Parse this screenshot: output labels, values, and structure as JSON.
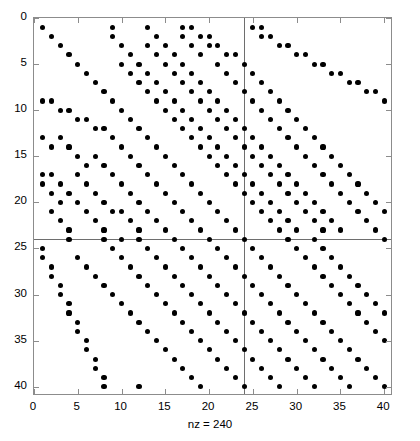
{
  "figure": {
    "type": "spy-plot",
    "background": "#ffffff",
    "marker_color": "#000000",
    "axis_color": "#8c8c8c",
    "line_color": "#6e6e6e"
  },
  "xlabel": "nz = 240",
  "axis": {
    "xticks": [
      0,
      5,
      10,
      15,
      20,
      25,
      30,
      35,
      40
    ],
    "yticks": [
      0,
      5,
      10,
      15,
      20,
      25,
      30,
      35,
      40
    ],
    "xlim": [
      0,
      41
    ],
    "ylim": [
      0,
      41
    ]
  },
  "chart_data": {
    "type": "scatter",
    "title": "",
    "xlabel": "nz = 240",
    "ylabel": "",
    "xlim": [
      0,
      41
    ],
    "ylim": [
      41,
      0
    ],
    "grid": false,
    "legend": null,
    "nz": 240,
    "matrix_size": [
      40,
      40
    ],
    "marker": "filled-circle",
    "full_row": 24,
    "full_column": 24,
    "points": [
      [
        1,
        1
      ],
      [
        1,
        9
      ],
      [
        1,
        13
      ],
      [
        1,
        17
      ],
      [
        1,
        18
      ],
      [
        1,
        25
      ],
      [
        1,
        26
      ],
      [
        2,
        2
      ],
      [
        2,
        9
      ],
      [
        2,
        14
      ],
      [
        2,
        17
      ],
      [
        2,
        19
      ],
      [
        2,
        20
      ],
      [
        2,
        26
      ],
      [
        2,
        27
      ],
      [
        3,
        3
      ],
      [
        3,
        10
      ],
      [
        3,
        13
      ],
      [
        3,
        15
      ],
      [
        3,
        18
      ],
      [
        3,
        20
      ],
      [
        3,
        21
      ],
      [
        3,
        28
      ],
      [
        3,
        29
      ],
      [
        4,
        4
      ],
      [
        4,
        11
      ],
      [
        4,
        14
      ],
      [
        4,
        16
      ],
      [
        4,
        19
      ],
      [
        4,
        22
      ],
      [
        4,
        23
      ],
      [
        4,
        30
      ],
      [
        4,
        31
      ],
      [
        5,
        5
      ],
      [
        5,
        10
      ],
      [
        5,
        12
      ],
      [
        5,
        15
      ],
      [
        5,
        17
      ],
      [
        5,
        21
      ],
      [
        5,
        24
      ],
      [
        5,
        32
      ],
      [
        5,
        33
      ],
      [
        6,
        6
      ],
      [
        6,
        11
      ],
      [
        6,
        13
      ],
      [
        6,
        16
      ],
      [
        6,
        18
      ],
      [
        6,
        22
      ],
      [
        6,
        25
      ],
      [
        6,
        34
      ],
      [
        6,
        35
      ],
      [
        7,
        7
      ],
      [
        7,
        12
      ],
      [
        7,
        14
      ],
      [
        7,
        17
      ],
      [
        7,
        19
      ],
      [
        7,
        23
      ],
      [
        7,
        26
      ],
      [
        7,
        36
      ],
      [
        7,
        37
      ],
      [
        8,
        8
      ],
      [
        8,
        13
      ],
      [
        8,
        15
      ],
      [
        8,
        18
      ],
      [
        8,
        20
      ],
      [
        8,
        24
      ],
      [
        8,
        27
      ],
      [
        8,
        38
      ],
      [
        8,
        39
      ],
      [
        9,
        1
      ],
      [
        9,
        2
      ],
      [
        9,
        9
      ],
      [
        9,
        14
      ],
      [
        9,
        16
      ],
      [
        9,
        19
      ],
      [
        9,
        21
      ],
      [
        9,
        25
      ],
      [
        9,
        28
      ],
      [
        9,
        40
      ],
      [
        10,
        3
      ],
      [
        10,
        4
      ],
      [
        10,
        10
      ],
      [
        10,
        15
      ],
      [
        10,
        17
      ],
      [
        10,
        20
      ],
      [
        10,
        22
      ],
      [
        10,
        26
      ],
      [
        10,
        29
      ],
      [
        11,
        5
      ],
      [
        11,
        6
      ],
      [
        11,
        11
      ],
      [
        11,
        16
      ],
      [
        11,
        18
      ],
      [
        11,
        21
      ],
      [
        11,
        23
      ],
      [
        11,
        27
      ],
      [
        11,
        30
      ],
      [
        12,
        7
      ],
      [
        12,
        8
      ],
      [
        12,
        12
      ],
      [
        12,
        17
      ],
      [
        12,
        19
      ],
      [
        12,
        22
      ],
      [
        12,
        24
      ],
      [
        12,
        28
      ],
      [
        12,
        31
      ],
      [
        13,
        1
      ],
      [
        13,
        3
      ],
      [
        13,
        9
      ],
      [
        13,
        13
      ],
      [
        13,
        18
      ],
      [
        13,
        20
      ],
      [
        13,
        23
      ],
      [
        13,
        25
      ],
      [
        13,
        29
      ],
      [
        13,
        32
      ],
      [
        14,
        2
      ],
      [
        14,
        4
      ],
      [
        14,
        10
      ],
      [
        14,
        14
      ],
      [
        14,
        19
      ],
      [
        14,
        21
      ],
      [
        14,
        24
      ],
      [
        14,
        26
      ],
      [
        14,
        30
      ],
      [
        14,
        33
      ],
      [
        15,
        5
      ],
      [
        15,
        7
      ],
      [
        15,
        11
      ],
      [
        15,
        15
      ],
      [
        15,
        20
      ],
      [
        15,
        22
      ],
      [
        15,
        25
      ],
      [
        15,
        27
      ],
      [
        15,
        31
      ],
      [
        15,
        34
      ],
      [
        16,
        6
      ],
      [
        16,
        8
      ],
      [
        16,
        12
      ],
      [
        16,
        16
      ],
      [
        16,
        21
      ],
      [
        16,
        23
      ],
      [
        16,
        26
      ],
      [
        16,
        28
      ],
      [
        16,
        32
      ],
      [
        16,
        35
      ],
      [
        17,
        1
      ],
      [
        17,
        2
      ],
      [
        17,
        5
      ],
      [
        17,
        9
      ],
      [
        17,
        13
      ],
      [
        17,
        17
      ],
      [
        17,
        22
      ],
      [
        17,
        24
      ],
      [
        17,
        27
      ],
      [
        17,
        29
      ],
      [
        17,
        33
      ],
      [
        17,
        36
      ],
      [
        18,
        1
      ],
      [
        18,
        3
      ],
      [
        18,
        6
      ],
      [
        18,
        10
      ],
      [
        18,
        14
      ],
      [
        18,
        18
      ],
      [
        18,
        23
      ],
      [
        18,
        25
      ],
      [
        18,
        28
      ],
      [
        18,
        30
      ],
      [
        18,
        34
      ],
      [
        18,
        37
      ],
      [
        19,
        2
      ],
      [
        19,
        4
      ],
      [
        19,
        7
      ],
      [
        19,
        11
      ],
      [
        19,
        15
      ],
      [
        19,
        19
      ],
      [
        19,
        24
      ],
      [
        19,
        26
      ],
      [
        19,
        29
      ],
      [
        19,
        31
      ],
      [
        19,
        35
      ],
      [
        19,
        38
      ],
      [
        20,
        3
      ],
      [
        20,
        5
      ],
      [
        20,
        8
      ],
      [
        20,
        12
      ],
      [
        20,
        16
      ],
      [
        20,
        20
      ],
      [
        20,
        25
      ],
      [
        20,
        27
      ],
      [
        20,
        30
      ],
      [
        20,
        32
      ],
      [
        20,
        36
      ],
      [
        20,
        39
      ],
      [
        21,
        2
      ],
      [
        21,
        6
      ],
      [
        21,
        9
      ],
      [
        21,
        10
      ],
      [
        21,
        13
      ],
      [
        21,
        17
      ],
      [
        21,
        21
      ],
      [
        21,
        26
      ],
      [
        21,
        28
      ],
      [
        21,
        31
      ],
      [
        21,
        33
      ],
      [
        21,
        37
      ],
      [
        21,
        40
      ],
      [
        22,
        3
      ],
      [
        22,
        7
      ],
      [
        22,
        11
      ],
      [
        22,
        14
      ],
      [
        22,
        18
      ],
      [
        22,
        22
      ],
      [
        22,
        27
      ],
      [
        22,
        29
      ],
      [
        22,
        32
      ],
      [
        22,
        34
      ],
      [
        22,
        38
      ],
      [
        23,
        4
      ],
      [
        23,
        8
      ],
      [
        23,
        12
      ],
      [
        23,
        15
      ],
      [
        23,
        19
      ],
      [
        23,
        23
      ],
      [
        23,
        28
      ],
      [
        23,
        30
      ],
      [
        23,
        33
      ],
      [
        23,
        35
      ],
      [
        23,
        39
      ],
      [
        24,
        4
      ],
      [
        24,
        8
      ],
      [
        24,
        10
      ],
      [
        24,
        12
      ],
      [
        24,
        16
      ],
      [
        24,
        20
      ],
      [
        24,
        24
      ],
      [
        24,
        29
      ],
      [
        24,
        32
      ],
      [
        24,
        40
      ],
      [
        25,
        1
      ],
      [
        25,
        9
      ],
      [
        25,
        13
      ],
      [
        25,
        17
      ],
      [
        25,
        21
      ],
      [
        25,
        25
      ],
      [
        25,
        30
      ],
      [
        25,
        33
      ],
      [
        26,
        1
      ],
      [
        26,
        5
      ],
      [
        26,
        10
      ],
      [
        26,
        14
      ],
      [
        26,
        18
      ],
      [
        26,
        22
      ],
      [
        26,
        26
      ],
      [
        26,
        31
      ],
      [
        26,
        34
      ],
      [
        27,
        2
      ],
      [
        27,
        6
      ],
      [
        27,
        11
      ],
      [
        27,
        15
      ],
      [
        27,
        19
      ],
      [
        27,
        23
      ],
      [
        27,
        27
      ],
      [
        27,
        32
      ],
      [
        27,
        35
      ],
      [
        28,
        2
      ],
      [
        28,
        7
      ],
      [
        28,
        12
      ],
      [
        28,
        16
      ],
      [
        28,
        20
      ],
      [
        28,
        24
      ],
      [
        28,
        28
      ],
      [
        28,
        33
      ],
      [
        28,
        36
      ],
      [
        29,
        3
      ],
      [
        29,
        8
      ],
      [
        29,
        13
      ],
      [
        29,
        17
      ],
      [
        29,
        21
      ],
      [
        29,
        25
      ],
      [
        29,
        29
      ],
      [
        29,
        34
      ],
      [
        29,
        37
      ],
      [
        30,
        3
      ],
      [
        30,
        9
      ],
      [
        30,
        14
      ],
      [
        30,
        18
      ],
      [
        30,
        22
      ],
      [
        30,
        26
      ],
      [
        30,
        30
      ],
      [
        30,
        35
      ],
      [
        30,
        38
      ],
      [
        31,
        4
      ],
      [
        31,
        10
      ],
      [
        31,
        15
      ],
      [
        31,
        19
      ],
      [
        31,
        23
      ],
      [
        31,
        27
      ],
      [
        31,
        31
      ],
      [
        31,
        36
      ],
      [
        31,
        39
      ],
      [
        32,
        4
      ],
      [
        32,
        11
      ],
      [
        32,
        16
      ],
      [
        32,
        20
      ],
      [
        32,
        24
      ],
      [
        32,
        28
      ],
      [
        32,
        32
      ],
      [
        32,
        37
      ],
      [
        32,
        40
      ],
      [
        33,
        5
      ],
      [
        33,
        12
      ],
      [
        33,
        17
      ],
      [
        33,
        21
      ],
      [
        33,
        25
      ],
      [
        33,
        29
      ],
      [
        33,
        33
      ],
      [
        33,
        38
      ],
      [
        34,
        5
      ],
      [
        34,
        13
      ],
      [
        34,
        18
      ],
      [
        34,
        22
      ],
      [
        34,
        26
      ],
      [
        34,
        30
      ],
      [
        34,
        34
      ],
      [
        34,
        39
      ],
      [
        35,
        6
      ],
      [
        35,
        14
      ],
      [
        35,
        19
      ],
      [
        35,
        23
      ],
      [
        35,
        27
      ],
      [
        35,
        31
      ],
      [
        35,
        35
      ],
      [
        35,
        40
      ],
      [
        36,
        6
      ],
      [
        36,
        15
      ],
      [
        36,
        20
      ],
      [
        36,
        24
      ],
      [
        36,
        28
      ],
      [
        36,
        32
      ],
      [
        36,
        36
      ],
      [
        37,
        7
      ],
      [
        37,
        16
      ],
      [
        37,
        21
      ],
      [
        37,
        25
      ],
      [
        37,
        29
      ],
      [
        37,
        33
      ],
      [
        37,
        37
      ],
      [
        38,
        7
      ],
      [
        38,
        17
      ],
      [
        38,
        22
      ],
      [
        38,
        26
      ],
      [
        38,
        30
      ],
      [
        38,
        34
      ],
      [
        38,
        38
      ],
      [
        39,
        8
      ],
      [
        39,
        18
      ],
      [
        39,
        23
      ],
      [
        39,
        27
      ],
      [
        39,
        31
      ],
      [
        39,
        35
      ],
      [
        39,
        39
      ],
      [
        40,
        8
      ],
      [
        40,
        12
      ],
      [
        40,
        19
      ],
      [
        40,
        24
      ],
      [
        40,
        28
      ],
      [
        40,
        32
      ],
      [
        40,
        36
      ],
      [
        40,
        40
      ]
    ]
  }
}
